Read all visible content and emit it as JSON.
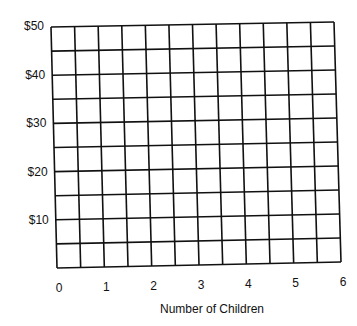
{
  "chart_data": {
    "type": "line",
    "title": "",
    "xlabel": "Number of Children",
    "ylabel": "",
    "x_ticks": [
      "0",
      "1",
      "2",
      "3",
      "4",
      "5",
      "6"
    ],
    "y_ticks": [
      "$50",
      "$40",
      "$30",
      "$20",
      "$10"
    ],
    "xlim": [
      0,
      6
    ],
    "ylim": [
      0,
      50
    ],
    "x_grid_step": 0.5,
    "y_grid_step": 5,
    "grid": true,
    "series": [],
    "legend": null,
    "note": "Blank graph-paper grid with no plotted data; 12 columns by 10 rows"
  },
  "colors": {
    "grid": "#111111",
    "background": "#ffffff",
    "text": "#111111"
  }
}
